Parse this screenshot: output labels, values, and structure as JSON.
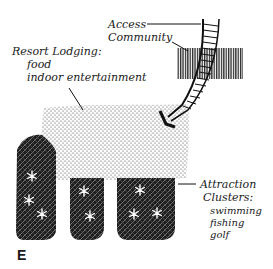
{
  "diagram": {
    "panel_letter": "E",
    "labels": {
      "access": "Access",
      "community": "Community",
      "resort_title": "Resort Lodging:",
      "resort_line1": "food",
      "resort_line2": "indoor entertainment",
      "attraction_title": "Attraction",
      "attraction_title2": "Clusters:",
      "attraction_line1": "swimming",
      "attraction_line2": "fishing",
      "attraction_line3": "golf"
    },
    "elements": [
      {
        "name": "community",
        "pattern": "vertical-hatch"
      },
      {
        "name": "access-route",
        "pattern": "ladder-arrow"
      },
      {
        "name": "resort-lodging",
        "pattern": "stipple"
      },
      {
        "name": "attraction-cluster-1",
        "pattern": "crosshatch-stars",
        "stars": 3
      },
      {
        "name": "attraction-cluster-2",
        "pattern": "crosshatch-stars",
        "stars": 2
      },
      {
        "name": "attraction-cluster-3",
        "pattern": "crosshatch-stars",
        "stars": 3
      }
    ],
    "colors": {
      "ink": "#1a1a1a",
      "paper": "#ffffff"
    }
  }
}
